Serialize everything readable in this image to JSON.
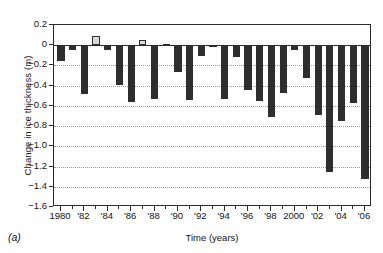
{
  "figure": {
    "panel_label": "(a)",
    "xlabel": "Time (years)",
    "ylabel": "Change in ice thickness (m)"
  },
  "axes": {
    "y_ticks": [
      "0.2",
      "0",
      "−0.2",
      "−0.4",
      "−0.6",
      "−0.8",
      "−1.0",
      "−1.2",
      "−1.4",
      "−1.6"
    ],
    "y_tick_values": [
      0.2,
      0,
      -0.2,
      -0.4,
      -0.6,
      -0.8,
      -1.0,
      -1.2,
      -1.4,
      -1.6
    ],
    "x_ticks": [
      "1980",
      "'82",
      "'84",
      "'86",
      "'88",
      "'90",
      "'92",
      "'94",
      "'96",
      "'98",
      "2000",
      "'02",
      "'04",
      "'06"
    ],
    "x_tick_years": [
      1980,
      1982,
      1984,
      1986,
      1988,
      1990,
      1992,
      1994,
      1996,
      1998,
      2000,
      2002,
      2004,
      2006
    ]
  },
  "colors": {
    "negative_bar": "#2e2e2e",
    "positive_bar": "#d9d9d9",
    "bar_outline": "#2e2e2e",
    "axis": "#2b2b2b",
    "gridline": "#9a9a9a",
    "background": "#ffffff"
  },
  "chart_data": {
    "type": "bar",
    "title": "",
    "xlabel": "Time (years)",
    "ylabel": "Change in ice thickness (m)",
    "ylim": [
      -1.6,
      0.2
    ],
    "xlim": [
      1979.4,
      2006.6
    ],
    "grid": true,
    "legend": "none",
    "annotations": [
      "(a)"
    ],
    "categories": [
      1980,
      1981,
      1982,
      1983,
      1984,
      1985,
      1986,
      1987,
      1988,
      1989,
      1990,
      1991,
      1992,
      1993,
      1994,
      1995,
      1996,
      1997,
      1998,
      1999,
      2000,
      2001,
      2002,
      2003,
      2004,
      2005,
      2006
    ],
    "values": [
      -0.16,
      -0.05,
      -0.48,
      0.09,
      -0.05,
      -0.39,
      -0.56,
      0.05,
      -0.53,
      0.01,
      -0.26,
      -0.54,
      -0.11,
      -0.02,
      -0.53,
      -0.12,
      -0.44,
      -0.55,
      -0.71,
      -0.47,
      -0.05,
      -0.32,
      -0.69,
      -1.25,
      -0.75,
      -0.57,
      -1.32
    ]
  }
}
